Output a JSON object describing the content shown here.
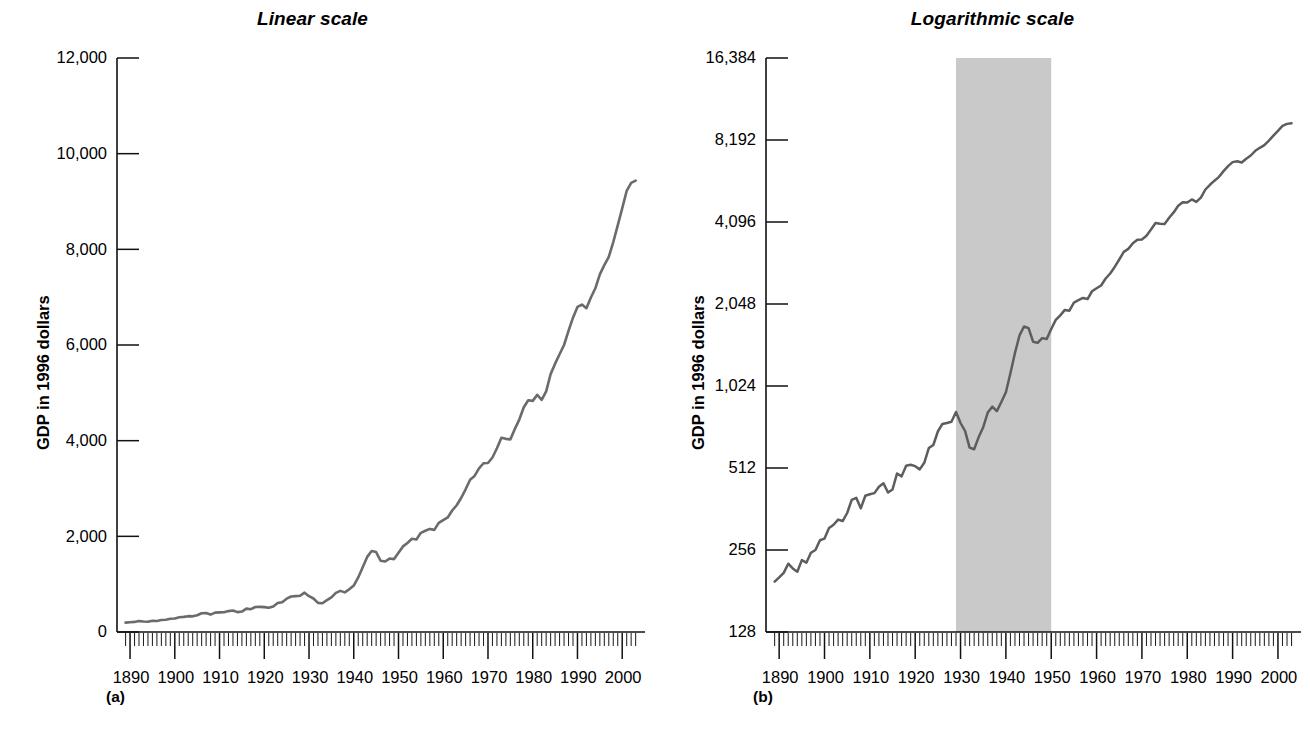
{
  "figure": {
    "panels": [
      {
        "tag": "(a)",
        "title": "Linear scale",
        "y_axis_label": "GDP in 1996 dollars",
        "scale": "linear",
        "y_ticks": [
          "0",
          "2,000",
          "4,000",
          "6,000",
          "8,000",
          "10,000",
          "12,000"
        ],
        "x_ticks": [
          "1890",
          "1900",
          "1910",
          "1920",
          "1930",
          "1940",
          "1950",
          "1960",
          "1970",
          "1980",
          "1990",
          "2000"
        ]
      },
      {
        "tag": "(b)",
        "title": "Logarithmic scale",
        "y_axis_label": "GDP in 1996 dollars",
        "scale": "log2",
        "y_ticks": [
          "128",
          "256",
          "512",
          "1,024",
          "2,048",
          "4,096",
          "8,192",
          "16,384"
        ],
        "x_ticks": [
          "1890",
          "1900",
          "1910",
          "1920",
          "1930",
          "1940",
          "1950",
          "1960",
          "1970",
          "1980",
          "1990",
          "2000"
        ],
        "shaded_region": {
          "start": 1929,
          "end": 1950,
          "color": "#c9c9c9"
        }
      }
    ]
  },
  "chart_data": [
    {
      "type": "line",
      "title": "Linear scale",
      "xlabel": "",
      "ylabel": "GDP in 1996 dollars",
      "xlim": [
        1888,
        2004
      ],
      "ylim": [
        0,
        12000
      ],
      "yscale": "linear",
      "ytick_values": [
        0,
        2000,
        4000,
        6000,
        8000,
        10000,
        12000
      ],
      "xtick_values": [
        1890,
        1900,
        1910,
        1920,
        1930,
        1940,
        1950,
        1960,
        1970,
        1980,
        1990,
        2000
      ],
      "grid": false,
      "legend": "none",
      "series": [
        {
          "name": "Real GDP",
          "color": "#6b6b6b",
          "x": [
            1889,
            1890,
            1891,
            1892,
            1893,
            1894,
            1895,
            1896,
            1897,
            1898,
            1899,
            1900,
            1901,
            1902,
            1903,
            1904,
            1905,
            1906,
            1907,
            1908,
            1909,
            1910,
            1911,
            1912,
            1913,
            1914,
            1915,
            1916,
            1917,
            1918,
            1919,
            1920,
            1921,
            1922,
            1923,
            1924,
            1925,
            1926,
            1927,
            1928,
            1929,
            1930,
            1931,
            1932,
            1933,
            1934,
            1935,
            1936,
            1937,
            1938,
            1939,
            1940,
            1941,
            1942,
            1943,
            1944,
            1945,
            1946,
            1947,
            1948,
            1949,
            1950,
            1951,
            1952,
            1953,
            1954,
            1955,
            1956,
            1957,
            1958,
            1959,
            1960,
            1961,
            1962,
            1963,
            1964,
            1965,
            1966,
            1967,
            1968,
            1969,
            1970,
            1971,
            1972,
            1973,
            1974,
            1975,
            1976,
            1977,
            1978,
            1979,
            1980,
            1981,
            1982,
            1983,
            1984,
            1985,
            1986,
            1987,
            1988,
            1989,
            1990,
            1991,
            1992,
            1993,
            1994,
            1995,
            1996,
            1997,
            1998,
            1999,
            2000,
            2001,
            2002,
            2003
          ],
          "y": [
            196,
            203,
            211,
            228,
            219,
            213,
            235,
            230,
            250,
            256,
            278,
            282,
            308,
            317,
            331,
            327,
            350,
            391,
            398,
            364,
            405,
            410,
            414,
            437,
            450,
            416,
            427,
            489,
            477,
            522,
            526,
            520,
            506,
            535,
            606,
            622,
            697,
            743,
            749,
            757,
            822,
            749,
            700,
            608,
            600,
            665,
            723,
            818,
            860,
            828,
            895,
            972,
            1140,
            1353,
            1570,
            1693,
            1671,
            1489,
            1474,
            1535,
            1524,
            1657,
            1790,
            1861,
            1948,
            1935,
            2073,
            2116,
            2155,
            2135,
            2281,
            2339,
            2394,
            2540,
            2650,
            2801,
            2983,
            3182,
            3263,
            3421,
            3528,
            3534,
            3649,
            3842,
            4061,
            4038,
            4027,
            4246,
            4441,
            4698,
            4844,
            4832,
            4957,
            4853,
            5031,
            5391,
            5610,
            5808,
            6000,
            6297,
            6571,
            6795,
            6845,
            6769,
            6992,
            7186,
            7476,
            7669,
            7843,
            8152,
            8500,
            8856,
            9223,
            9388,
            9435,
            9626,
            9928
          ]
        }
      ]
    },
    {
      "type": "line",
      "title": "Logarithmic scale",
      "xlabel": "",
      "ylabel": "GDP in 1996 dollars",
      "xlim": [
        1888,
        2004
      ],
      "ylim": [
        128,
        16384
      ],
      "yscale": "log2",
      "ytick_values": [
        128,
        256,
        512,
        1024,
        2048,
        4096,
        8192,
        16384
      ],
      "xtick_values": [
        1890,
        1900,
        1910,
        1920,
        1930,
        1940,
        1950,
        1960,
        1970,
        1980,
        1990,
        2000
      ],
      "grid": false,
      "legend": "none",
      "annotations": [
        {
          "kind": "vspan",
          "x0": 1929,
          "x1": 1950,
          "color": "#c9c9c9",
          "label": ""
        }
      ],
      "series": [
        {
          "name": "Real GDP",
          "color": "#5d5d5d",
          "x": [
            1889,
            1890,
            1891,
            1892,
            1893,
            1894,
            1895,
            1896,
            1897,
            1898,
            1899,
            1900,
            1901,
            1902,
            1903,
            1904,
            1905,
            1906,
            1907,
            1908,
            1909,
            1910,
            1911,
            1912,
            1913,
            1914,
            1915,
            1916,
            1917,
            1918,
            1919,
            1920,
            1921,
            1922,
            1923,
            1924,
            1925,
            1926,
            1927,
            1928,
            1929,
            1930,
            1931,
            1932,
            1933,
            1934,
            1935,
            1936,
            1937,
            1938,
            1939,
            1940,
            1941,
            1942,
            1943,
            1944,
            1945,
            1946,
            1947,
            1948,
            1949,
            1950,
            1951,
            1952,
            1953,
            1954,
            1955,
            1956,
            1957,
            1958,
            1959,
            1960,
            1961,
            1962,
            1963,
            1964,
            1965,
            1966,
            1967,
            1968,
            1969,
            1970,
            1971,
            1972,
            1973,
            1974,
            1975,
            1976,
            1977,
            1978,
            1979,
            1980,
            1981,
            1982,
            1983,
            1984,
            1985,
            1986,
            1987,
            1988,
            1989,
            1990,
            1991,
            1992,
            1993,
            1994,
            1995,
            1996,
            1997,
            1998,
            1999,
            2000,
            2001,
            2002,
            2003
          ],
          "y": [
            196,
            203,
            211,
            228,
            219,
            213,
            235,
            230,
            250,
            256,
            278,
            282,
            308,
            317,
            331,
            327,
            350,
            391,
            398,
            364,
            405,
            410,
            414,
            437,
            450,
            416,
            427,
            489,
            477,
            522,
            526,
            520,
            506,
            535,
            606,
            622,
            697,
            743,
            749,
            757,
            822,
            749,
            700,
            608,
            600,
            665,
            723,
            818,
            860,
            828,
            895,
            972,
            1140,
            1353,
            1570,
            1693,
            1671,
            1489,
            1474,
            1535,
            1524,
            1657,
            1790,
            1861,
            1948,
            1935,
            2073,
            2116,
            2155,
            2135,
            2281,
            2339,
            2394,
            2540,
            2650,
            2801,
            2983,
            3182,
            3263,
            3421,
            3528,
            3534,
            3649,
            3842,
            4061,
            4038,
            4027,
            4246,
            4441,
            4698,
            4844,
            4832,
            4957,
            4853,
            5031,
            5391,
            5610,
            5808,
            6000,
            6297,
            6571,
            6795,
            6845,
            6769,
            6992,
            7186,
            7476,
            7669,
            7843,
            8152,
            8500,
            8856,
            9223,
            9388,
            9435,
            9626,
            9928
          ]
        }
      ]
    }
  ]
}
